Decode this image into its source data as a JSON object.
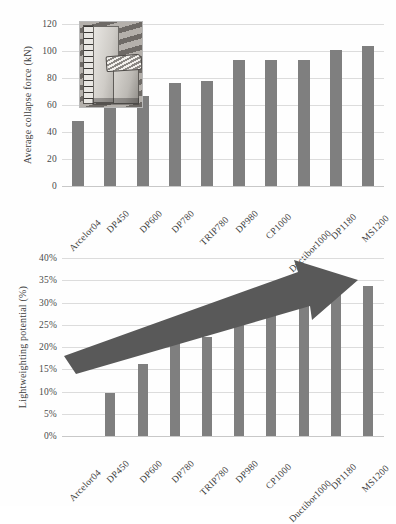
{
  "figure": {
    "background": "#fefefe",
    "bar_color": "#7f7f7f",
    "arrow_color": "#595959",
    "grid_color": "#dcdcdc"
  },
  "chart_data": [
    {
      "type": "bar",
      "id": "average-collapse-force",
      "title": "",
      "xlabel": "",
      "ylabel": "Average collapse force (kN)",
      "ylim": [
        0,
        120
      ],
      "yticks": [
        0,
        20,
        40,
        60,
        80,
        100,
        120
      ],
      "ytick_labels": [
        "0",
        "20",
        "40",
        "60",
        "80",
        "100",
        "120"
      ],
      "grid": true,
      "legend": "none",
      "categories": [
        "Arcelor04",
        "DP450",
        "DP600",
        "DP780",
        "TRIP780",
        "DP980",
        "CP1000",
        "Ductibor1000",
        "DP1180",
        "MS1200"
      ],
      "values": [
        48,
        58,
        67,
        76.5,
        77.5,
        93,
        93,
        93,
        100.5,
        103.5
      ],
      "annotations": [
        {
          "name": "inset-photo",
          "kind": "photograph",
          "description": "Axially crushed square tube specimen beside a measuring rule"
        }
      ]
    },
    {
      "type": "bar",
      "id": "lightweighting-potential",
      "title": "",
      "xlabel": "",
      "ylabel": "Lightweighting potential (%)",
      "ylim": [
        0,
        40
      ],
      "yticks": [
        0,
        5,
        10,
        15,
        20,
        25,
        30,
        35,
        40
      ],
      "ytick_labels": [
        "0%",
        "5%",
        "10%",
        "15%",
        "20%",
        "25%",
        "30%",
        "35%",
        "40%"
      ],
      "grid": true,
      "legend": "none",
      "categories": [
        "Arcelor04",
        "DP450",
        "DP600",
        "DP780",
        "TRIP780",
        "DP980",
        "CP1000",
        "Ductibor1000",
        "DP1180",
        "MS1200"
      ],
      "values": [
        0,
        9.7,
        16.2,
        21.8,
        22.3,
        26.6,
        28.1,
        29.6,
        32.6,
        33.6
      ],
      "annotations": [
        {
          "name": "trend-arrow",
          "kind": "arrow",
          "description": "Thick upward-right arrow indicating increasing lightweighting potential"
        }
      ]
    }
  ]
}
